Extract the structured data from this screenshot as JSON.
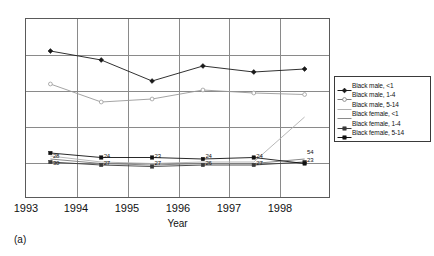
{
  "chart_data": {
    "type": "line",
    "title": "",
    "xlabel": "Year",
    "ylabel": "",
    "caption": "(a)",
    "categories": [
      "1993",
      "1994",
      "1995",
      "1996",
      "1997",
      "1998"
    ],
    "x": [
      1993,
      1994,
      1995,
      1996,
      1997,
      1998
    ],
    "ylim": [
      0,
      120
    ],
    "grid": "both",
    "legend_position": "right",
    "series": [
      {
        "name": "Black male, <1",
        "marker": "filled-diamond",
        "color": "#1a1a1a",
        "values": [
          98,
          92,
          78,
          88,
          84,
          86
        ],
        "data_labels": []
      },
      {
        "name": "Black male, 1-4",
        "marker": "open-circle",
        "color": "#9a9a9a",
        "values": [
          76,
          64,
          66,
          72,
          70,
          69
        ],
        "data_labels": []
      },
      {
        "name": "Black male, 5-14",
        "marker": "line",
        "color": "#b0b0b0",
        "values": [
          28,
          24,
          23,
          24,
          24,
          54
        ],
        "data_labels": [
          "28",
          "24",
          "23",
          "24",
          "24",
          "54"
        ]
      },
      {
        "name": "Black female, <1",
        "marker": "line",
        "color": "#7a7a7a",
        "values": [
          26,
          23,
          22,
          23,
          23,
          26
        ],
        "data_labels": []
      },
      {
        "name": "Black female, 1-4",
        "marker": "filled-square",
        "color": "#3a3a3a",
        "values": [
          24,
          22,
          21,
          22,
          22,
          24
        ],
        "data_labels": []
      },
      {
        "name": "Black female, 5-14",
        "marker": "filled-square",
        "color": "#111111",
        "values": [
          30,
          27,
          27,
          26,
          27,
          23
        ],
        "data_labels": [
          "30",
          "27",
          "27",
          "26",
          "27",
          "23"
        ]
      }
    ],
    "annotations": {
      "upper_point_labels": [
        "28",
        "24",
        "23",
        "24",
        "24",
        "54"
      ],
      "lower_point_labels": [
        "30",
        "27",
        "27",
        "26",
        "27",
        "23"
      ]
    }
  },
  "legend": {
    "items": [
      {
        "label": "Black male, <1",
        "marker": "filled-diamond",
        "color": "#1a1a1a"
      },
      {
        "label": "Black male, 1-4",
        "marker": "open-circle",
        "color": "#7a7a7a"
      },
      {
        "label": "Black male, 5-14",
        "marker": "line",
        "color": "#b0b0b0"
      },
      {
        "label": "Black female, <1",
        "marker": "line",
        "color": "#8a8a8a"
      },
      {
        "label": "Black female, 1-4",
        "marker": "filled-square",
        "color": "#3a3a3a"
      },
      {
        "label": "Black female, 5-14",
        "marker": "filled-square",
        "color": "#111111"
      }
    ]
  }
}
